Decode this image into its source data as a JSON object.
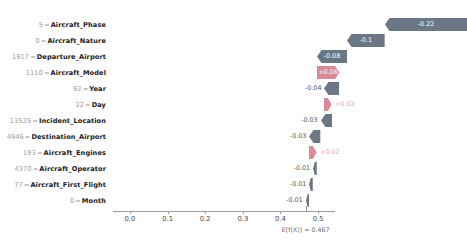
{
  "chart_data": {
    "type": "bar",
    "chart_kind": "shap-waterfall",
    "title": "",
    "xlabel": "",
    "ylabel": "",
    "xlim": [
      -0.045,
      0.545
    ],
    "xticks": [
      "0.0",
      "0.1",
      "0.2",
      "0.3",
      "0.4",
      "0.5"
    ],
    "xtickvalues": [
      0.0,
      0.1,
      0.2,
      0.3,
      0.4,
      0.5
    ],
    "grid": false,
    "legend": "none",
    "base_value": 0.467,
    "base_value_label": "E[f(X)] = 0.467",
    "colors": {
      "negative": "#6b7785",
      "positive": "#d98a96",
      "negative_text": "#4c5763",
      "positive_text": "#e8a9b4",
      "inbar_text": "#ffffff",
      "axis": "#9a9a9a",
      "index_text": "#9a9a9a",
      "feature_text": "#1a1a1a"
    },
    "rows": [
      {
        "index": "5",
        "feature": "Aircraft_Phase",
        "value": -0.22,
        "label": "-0.22",
        "sign": "neg",
        "label_inside": true
      },
      {
        "index": "0",
        "feature": "Aircraft_Nature",
        "value": -0.1,
        "label": "-0.1",
        "sign": "neg",
        "label_inside": true
      },
      {
        "index": "1917",
        "feature": "Departure_Airport",
        "value": -0.08,
        "label": "-0.08",
        "sign": "neg",
        "label_inside": true
      },
      {
        "index": "1110",
        "feature": "Aircraft_Model",
        "value": 0.06,
        "label": "+0.06",
        "sign": "pos",
        "label_inside": true
      },
      {
        "index": "92",
        "feature": "Year",
        "value": -0.04,
        "label": "-0.04",
        "sign": "neg",
        "label_inside": false
      },
      {
        "index": "22",
        "feature": "Day",
        "value": 0.02,
        "label": "+0.02",
        "sign": "pos",
        "label_inside": false
      },
      {
        "index": "13525",
        "feature": "Incident_Location",
        "value": -0.03,
        "label": "-0.03",
        "sign": "neg",
        "label_inside": false
      },
      {
        "index": "4946",
        "feature": "Destination_Airport",
        "value": -0.03,
        "label": "-0.03",
        "sign": "neg",
        "label_inside": false
      },
      {
        "index": "193",
        "feature": "Aircraft_Engines",
        "value": 0.02,
        "label": "+0.02",
        "sign": "pos",
        "label_inside": false
      },
      {
        "index": "4370",
        "feature": "Aircraft_Operator",
        "value": -0.01,
        "label": "-0.01",
        "sign": "neg",
        "label_inside": false
      },
      {
        "index": "77",
        "feature": "Aircraft_First_Flight",
        "value": -0.01,
        "label": "-0.01",
        "sign": "neg",
        "label_inside": false
      },
      {
        "index": "0",
        "feature": "Month",
        "value": -0.01,
        "label": "-0.01",
        "sign": "neg",
        "label_inside": false
      }
    ]
  }
}
